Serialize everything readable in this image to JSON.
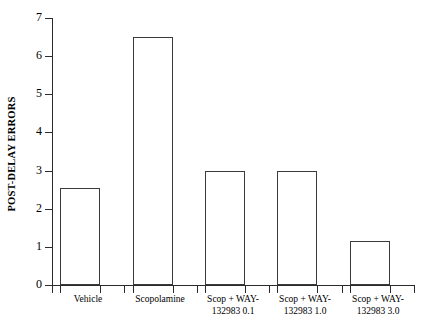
{
  "chart_data": {
    "type": "bar",
    "title": "",
    "xlabel": "",
    "ylabel": "POST-DELAY ERRORS",
    "ylim": [
      0,
      7
    ],
    "ytick_values": [
      0,
      1,
      2,
      3,
      4,
      5,
      6,
      7
    ],
    "ytick_labels": [
      "0",
      "1",
      "2",
      "3",
      "4",
      "5",
      "6",
      "7"
    ],
    "grid": false,
    "legend": "none",
    "bar_facecolor": "#ffffff",
    "bar_edgecolor": "#3a3a3a",
    "categories": [
      "Vehicle",
      "Scopolamine",
      "Scop + WAY-132983 0.1",
      "Scop + WAY-132983 1.0",
      "Scop + WAY-132983 3.0"
    ],
    "category_lines": [
      [
        "Vehicle"
      ],
      [
        "Scopolamine"
      ],
      [
        "Scop + WAY-",
        "132983 0.1"
      ],
      [
        "Scop + WAY-",
        "132983 1.0"
      ],
      [
        "Scop + WAY-",
        "132983 3.0"
      ]
    ],
    "values": [
      2.55,
      6.5,
      3.0,
      3.0,
      1.15
    ]
  }
}
